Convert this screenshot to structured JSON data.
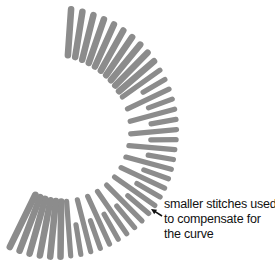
{
  "annotation": {
    "lines": [
      "smaller stitches used",
      "to compensate for",
      "the curve"
    ],
    "arrow": {
      "from": [
        162,
        216
      ],
      "to": [
        151,
        209
      ]
    }
  },
  "style": {
    "stitch_color": "#8c8c8c",
    "background": "#ffffff",
    "stitch_width": 8.4,
    "text_color": "#111111"
  },
  "chart_data": {
    "type": "diagram",
    "center": [
      62,
      140
    ],
    "stitches": {
      "angle_start_deg": -86,
      "angle_end_deg": 116,
      "count": 41,
      "radius_mid_keypoints": [
        [
          -86,
          108
        ],
        [
          -40,
          98
        ],
        [
          6,
          90
        ],
        [
          60,
          88
        ],
        [
          116,
          90
        ]
      ],
      "half_width_keypoints": [
        [
          -86,
          23
        ],
        [
          6,
          23
        ],
        [
          116,
          29
        ]
      ],
      "short_stitch_range_deg": [
        -40,
        88
      ],
      "short_stitch_fraction": 0.55
    }
  }
}
